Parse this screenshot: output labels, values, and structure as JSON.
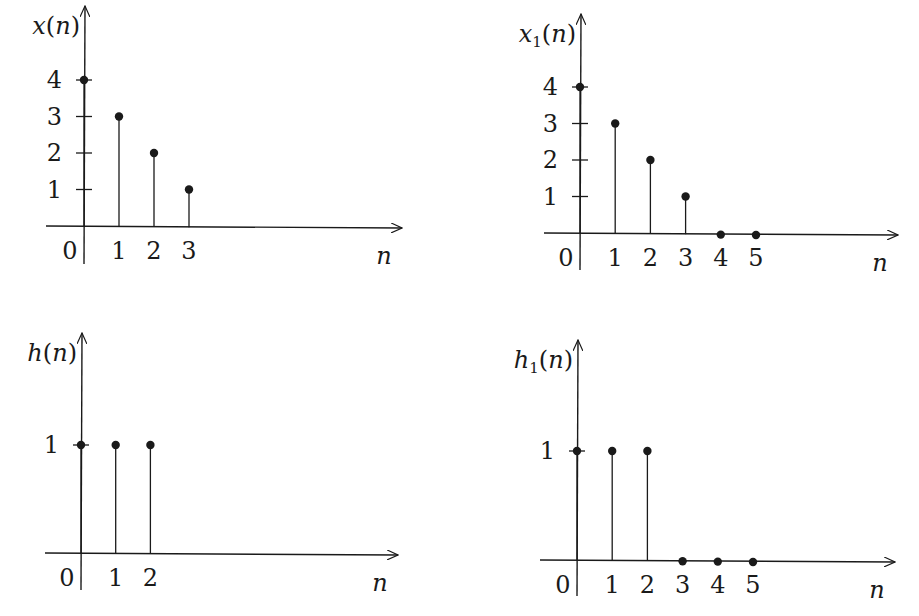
{
  "chart_data": [
    {
      "type": "stem",
      "id": "x",
      "ylabel": "x(n)",
      "xlabel": "n",
      "x": [
        0,
        1,
        2,
        3
      ],
      "values": [
        4,
        3,
        2,
        1
      ],
      "xticks": [
        "0",
        "1",
        "2",
        "3"
      ],
      "yticks": [
        "1",
        "2",
        "3",
        "4"
      ],
      "layout": {
        "origin": [
          84,
          226
        ],
        "dx": 35,
        "dy": 36.5,
        "xaxis_end": 402,
        "xaxis_start": 46,
        "yaxis_top": 6,
        "yaxis_bottom": 264
      }
    },
    {
      "type": "stem",
      "id": "x1",
      "ylabel": "x1(n)",
      "ylabel_base": "x",
      "ylabel_sub": "1",
      "xlabel": "n",
      "x": [
        0,
        1,
        2,
        3,
        4,
        5
      ],
      "values": [
        4,
        3,
        2,
        1,
        0,
        0
      ],
      "xticks": [
        "0",
        "1",
        "2",
        "3",
        "4",
        "5"
      ],
      "yticks": [
        "1",
        "2",
        "3",
        "4"
      ],
      "layout": {
        "origin": [
          580,
          233
        ],
        "dx": 35.2,
        "dy": 36.5,
        "xaxis_end": 898,
        "xaxis_start": 544,
        "yaxis_top": 14,
        "yaxis_bottom": 270
      }
    },
    {
      "type": "stem",
      "id": "h",
      "ylabel": "h(n)",
      "xlabel": "n",
      "x": [
        0,
        1,
        2
      ],
      "values": [
        1,
        1,
        1
      ],
      "xticks": [
        "0",
        "1",
        "2"
      ],
      "yticks": [
        "1"
      ],
      "layout": {
        "origin": [
          81,
          553
        ],
        "dx": 34.7,
        "dy": 108,
        "xaxis_end": 398,
        "xaxis_start": 45,
        "yaxis_top": 333,
        "yaxis_bottom": 590
      }
    },
    {
      "type": "stem",
      "id": "h1",
      "ylabel": "h1(n)",
      "ylabel_base": "h",
      "ylabel_sub": "1",
      "xlabel": "n",
      "x": [
        0,
        1,
        2,
        3,
        4,
        5
      ],
      "values": [
        1,
        1,
        1,
        0,
        0,
        0
      ],
      "xticks": [
        "0",
        "1",
        "2",
        "3",
        "4",
        "5"
      ],
      "yticks": [
        "1"
      ],
      "layout": {
        "origin": [
          577,
          560
        ],
        "dx": 35.2,
        "dy": 109,
        "xaxis_end": 895,
        "xaxis_start": 540,
        "yaxis_top": 340,
        "yaxis_bottom": 596
      }
    }
  ],
  "labels": {
    "x": {
      "title": "x(n)",
      "axis": "n"
    },
    "x1": {
      "title_base": "x",
      "title_sub": "1",
      "title_rest": "(n)",
      "axis": "n"
    },
    "h": {
      "title": "h(n)",
      "axis": "n"
    },
    "h1": {
      "title_base": "h",
      "title_sub": "1",
      "title_rest": "(n)",
      "axis": "n"
    }
  },
  "colors": {
    "ink": "#1a1a1a",
    "background": "#ffffff"
  }
}
